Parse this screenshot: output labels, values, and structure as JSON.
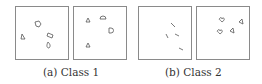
{
  "figure": {
    "subfigures": [
      {
        "label": "(a) Class 1",
        "panels": [
          {
            "shapes": [
              {
                "type": "pentagon",
                "x": 21,
                "y": 17
              },
              {
                "type": "triangle",
                "x": 7,
                "y": 29
              },
              {
                "type": "oblong",
                "x": 34,
                "y": 28
              },
              {
                "type": "teardrop",
                "x": 32,
                "y": 38
              }
            ]
          },
          {
            "shapes": [
              {
                "type": "triangle",
                "x": 14,
                "y": 13
              },
              {
                "type": "semicircle",
                "x": 28,
                "y": 9
              },
              {
                "type": "d-shape",
                "x": 37,
                "y": 23
              },
              {
                "type": "triangle",
                "x": 14,
                "y": 38
              }
            ]
          }
        ]
      },
      {
        "label": "(b) Class 2",
        "panels": [
          {
            "shapes": [
              {
                "type": "dash",
                "x": 34,
                "y": 18
              },
              {
                "type": "dash",
                "x": 28,
                "y": 29
              },
              {
                "type": "dash",
                "x": 38,
                "y": 28
              },
              {
                "type": "dash",
                "x": 42,
                "y": 42
              }
            ]
          },
          {
            "shapes": [
              {
                "type": "heart",
                "x": 25,
                "y": 13
              },
              {
                "type": "triangle",
                "x": 45,
                "y": 15
              },
              {
                "type": "heart",
                "x": 23,
                "y": 25
              },
              {
                "type": "triangle",
                "x": 36,
                "y": 23
              }
            ]
          }
        ]
      }
    ]
  }
}
